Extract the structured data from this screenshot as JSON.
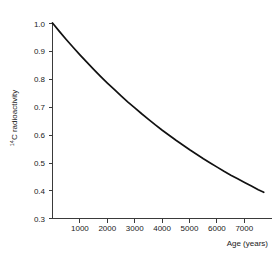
{
  "chart_data": {
    "type": "line",
    "title": "",
    "subtitle": "",
    "xlabel": "Age (years)",
    "ylabel": "14C radioactivity",
    "ylabel_prefix": "14",
    "ylabel_rest": "C radioactivity",
    "xlim": [
      0,
      8000
    ],
    "ylim": [
      0.3,
      1.0
    ],
    "grid": false,
    "legend": "none",
    "xticks": [
      1000,
      2000,
      3000,
      4000,
      5000,
      6000,
      7000
    ],
    "xtick_labels": [
      "1000",
      "2000",
      "3000",
      "4000",
      "5000",
      "6000",
      "7000"
    ],
    "yticks": [
      0.3,
      0.4,
      0.5,
      0.6,
      0.7,
      0.8,
      0.9,
      1.0
    ],
    "ytick_labels": [
      "0.3",
      "0.4",
      "0.5",
      "0.6",
      "0.7",
      "0.8",
      "0.9",
      "1.0"
    ],
    "annotations": [],
    "series": [
      {
        "name": "14C decay",
        "color": "#111111",
        "half_life_years": 5730,
        "x": [
          0,
          250,
          500,
          750,
          1000,
          1250,
          1500,
          1750,
          2000,
          2250,
          2500,
          2750,
          3000,
          3250,
          3500,
          3750,
          4000,
          4250,
          4500,
          4750,
          5000,
          5250,
          5500,
          5750,
          6000,
          6250,
          6500,
          6750,
          7000,
          7250,
          7500,
          7700
        ],
        "y": [
          1.0,
          0.97,
          0.941,
          0.913,
          0.886,
          0.86,
          0.834,
          0.809,
          0.785,
          0.762,
          0.739,
          0.717,
          0.696,
          0.675,
          0.655,
          0.635,
          0.616,
          0.598,
          0.58,
          0.563,
          0.546,
          0.53,
          0.514,
          0.499,
          0.484,
          0.469,
          0.455,
          0.442,
          0.429,
          0.416,
          0.403,
          0.394
        ]
      }
    ]
  },
  "axis": {
    "x_title": "Age (years)",
    "y_title_sup": "14",
    "y_title_main": "C radioactivity"
  }
}
